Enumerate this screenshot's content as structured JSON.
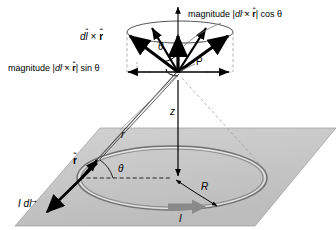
{
  "figure": {
    "kind": "physics-vector-diagram",
    "background_color": "#ffffff",
    "plane_fill": "#c9c9c9",
    "line_color": "#000000",
    "loop_color": "#6e6e6e",
    "current_arrow_color": "#8a8a8a"
  },
  "labels": {
    "top_magnitude": {
      "prefix": "magnitude |",
      "d": "d",
      "l": "l",
      "l_accent": "→",
      "times": "×",
      "r": "r",
      "r_accent": "ˆ",
      "suffix": "| cos ",
      "theta": "θ"
    },
    "left_magnitude": {
      "prefix": "magnitude |",
      "d": "d",
      "l": "l",
      "l_accent": "→",
      "times": "×",
      "r": "r",
      "r_accent": "ˆ",
      "suffix": "| sin ",
      "theta": "θ"
    },
    "cross_product": {
      "d": "d",
      "l": "l",
      "l_accent": "ˆ",
      "times": "×",
      "r": "r",
      "r_accent": "ˆ"
    },
    "current_element": {
      "i": "I",
      "d": "d",
      "l": "l",
      "l_accent": "→"
    },
    "point_p": "P",
    "theta_top": "θ",
    "theta_plane": "θ",
    "r_distance": "r",
    "r_hat": {
      "r": "r",
      "accent": "ˆ"
    },
    "z_axis": "z",
    "radius": "R",
    "current": "I"
  },
  "geometry": {
    "apex_point": {
      "x": 178,
      "y": 72
    },
    "cone_top_ellipse": {
      "cx": 180,
      "cy": 32,
      "rx": 53,
      "ry": 11
    },
    "loop_ellipse": {
      "cx": 172,
      "cy": 178,
      "rx": 95,
      "ry": 32
    },
    "plane_corners": [
      [
        100,
        128
      ],
      [
        336,
        128
      ],
      [
        255,
        226
      ],
      [
        15,
        226
      ]
    ],
    "z_axis_top": {
      "x": 178,
      "y": 5
    },
    "source_point": {
      "x": 86,
      "y": 172
    }
  }
}
